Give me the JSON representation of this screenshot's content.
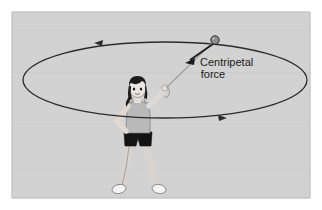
{
  "figure": {
    "panel": {
      "background_color": "#d2d2d2",
      "border_color": "#c8c8c8",
      "x": 12,
      "y": 12,
      "width": 298,
      "height": 186
    },
    "page_background_color": "#ffffff"
  },
  "annotations": {
    "force_label": {
      "line1": "Centripetal",
      "line2": "force",
      "x": 200,
      "y": 66,
      "color": "#1a1a1a"
    }
  },
  "orbit": {
    "name": "circular-path-ellipse",
    "center_x": 165,
    "center_y": 80,
    "radius_x": 142,
    "radius_y": 38,
    "stroke_color": "#2b2b2b",
    "stroke_width": 1.3,
    "direction_arrows": [
      {
        "name": "path-arrow-left",
        "x": 98,
        "y": 44,
        "points": "left"
      },
      {
        "name": "path-arrow-right",
        "x": 222,
        "y": 117,
        "points": "right"
      }
    ]
  },
  "ball": {
    "name": "whirling-ball",
    "x": 215,
    "y": 40,
    "radius": 4.2,
    "fill_color": "#8e8e8e",
    "stroke_color": "#2b2b2b"
  },
  "string": {
    "name": "string-from-hand-to-ball",
    "x1": 163,
    "y1": 90,
    "x2": 213,
    "y2": 42,
    "stroke_color": "#9a9a9a"
  },
  "force_arrow": {
    "name": "centripetal-force-arrow",
    "x1": 213,
    "y1": 43,
    "x2": 187,
    "y2": 62,
    "stroke_color": "#1a1a1a",
    "stroke_width": 1.6
  },
  "person": {
    "name": "girl-whirling-ball",
    "skin_color": "#e9e4df",
    "hair_color": "#1c1c1c",
    "shirt_color": "#b9b9b9",
    "shorts_color": "#141414",
    "shoe_color": "#f2f2f2",
    "outline_color": "#555555",
    "head_x": 137,
    "head_y": 89
  }
}
